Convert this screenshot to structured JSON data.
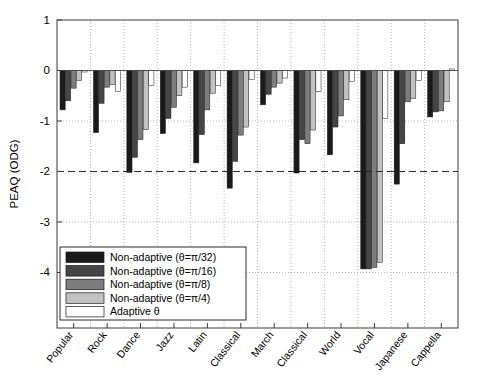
{
  "chart_data": {
    "type": "bar",
    "title": "",
    "subtitle": "",
    "xlabel": "",
    "ylabel": "PEAQ (ODG)",
    "ylim": [
      -5.1,
      1
    ],
    "yticks": [
      1,
      0,
      -1,
      -2,
      -3,
      -4
    ],
    "ytick_labels": [
      "1",
      "0",
      "-1",
      "-2",
      "-3",
      "-4"
    ],
    "grid": true,
    "grid_axis": "both",
    "legend_position": "lower-left",
    "orientation": "vertical",
    "annotations": [
      {
        "type": "hline",
        "value": -2,
        "style": "dashed",
        "label": ""
      }
    ],
    "categories": [
      "Popular",
      "Rock",
      "Dance",
      "Jazz",
      "Latin",
      "Classical",
      "March",
      "Classical",
      "World",
      "Vocal",
      "Japanese",
      "Cappella"
    ],
    "series": [
      {
        "name": "Non-adaptive (θ=π/32)",
        "color": "#1a1a1a",
        "values": [
          -0.78,
          -1.23,
          -2.02,
          -1.25,
          -1.83,
          -2.33,
          -0.68,
          -2.03,
          -1.67,
          -3.93,
          -2.25,
          -0.92
        ]
      },
      {
        "name": "Non-adaptive (θ=π/16)",
        "color": "#464646",
        "values": [
          -0.6,
          -0.65,
          -1.72,
          -0.95,
          -1.27,
          -1.8,
          -0.47,
          -1.37,
          -1.12,
          -3.93,
          -1.45,
          -0.82
        ]
      },
      {
        "name": "Non-adaptive (θ=π/8)",
        "color": "#7d7d7d",
        "values": [
          -0.35,
          -0.33,
          -1.37,
          -0.73,
          -0.78,
          -1.28,
          -0.33,
          -1.45,
          -0.9,
          -3.9,
          -0.62,
          -0.8
        ]
      },
      {
        "name": "Non-adaptive (θ=π/4)",
        "color": "#c2c2c2",
        "values": [
          -0.2,
          -0.28,
          -1.17,
          -0.5,
          -0.45,
          -1.12,
          -0.25,
          -1.18,
          -0.58,
          -3.8,
          -0.55,
          -0.62
        ]
      },
      {
        "name": "Adaptive θ",
        "color": "#ffffff",
        "values": [
          -0.03,
          -0.42,
          -0.3,
          -0.33,
          -0.3,
          -0.18,
          -0.15,
          -0.42,
          -0.22,
          -0.95,
          -0.2,
          0.03
        ]
      }
    ]
  },
  "legend": {
    "entries": [
      {
        "label": "Non-adaptive (θ=π/32)",
        "color": "#1a1a1a"
      },
      {
        "label": "Non-adaptive (θ=π/16)",
        "color": "#464646"
      },
      {
        "label": "Non-adaptive (θ=π/8)",
        "color": "#7d7d7d"
      },
      {
        "label": "Non-adaptive (θ=π/4)",
        "color": "#c2c2c2"
      },
      {
        "label": "Adaptive θ",
        "color": "#ffffff"
      }
    ]
  },
  "axes": {
    "y_title": "PEAQ (ODG)",
    "y_tick_labels": [
      "1",
      "0",
      "-1",
      "-2",
      "-3",
      "-4"
    ],
    "x_tick_labels": [
      "Popular",
      "Rock",
      "Dance",
      "Jazz",
      "Latin",
      "Classical",
      "March",
      "Classical",
      "World",
      "Vocal",
      "Japanese",
      "Cappella"
    ]
  },
  "colors": {
    "frame": "#3a3a3a",
    "grid": "#9a9a9a",
    "threshold_line": "#2a2a2a",
    "background": "#ffffff"
  }
}
